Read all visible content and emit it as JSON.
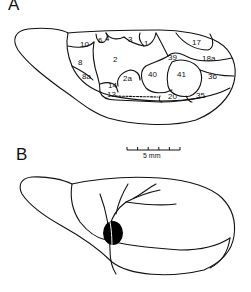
{
  "panels": {
    "a": {
      "label": "A"
    },
    "b": {
      "label": "B"
    }
  },
  "areas": [
    {
      "name": "10",
      "x": 84,
      "y": 44
    },
    {
      "name": "6",
      "x": 100,
      "y": 40
    },
    {
      "name": "4",
      "x": 107,
      "y": 38
    },
    {
      "name": "3",
      "x": 130,
      "y": 38
    },
    {
      "name": "1",
      "x": 145,
      "y": 43
    },
    {
      "name": "17",
      "x": 196,
      "y": 43
    },
    {
      "name": "2",
      "x": 115,
      "y": 60
    },
    {
      "name": "39",
      "x": 173,
      "y": 59
    },
    {
      "name": "18a",
      "x": 206,
      "y": 60
    },
    {
      "name": "8",
      "x": 80,
      "y": 64
    },
    {
      "name": "2a",
      "x": 127,
      "y": 79
    },
    {
      "name": "40",
      "x": 153,
      "y": 77
    },
    {
      "name": "41",
      "x": 182,
      "y": 77
    },
    {
      "name": "36",
      "x": 211,
      "y": 79
    },
    {
      "name": "8a",
      "x": 85,
      "y": 78
    },
    {
      "name": "14",
      "x": 110,
      "y": 87
    },
    {
      "name": "13",
      "x": 108,
      "y": 96
    },
    {
      "name": "20",
      "x": 171,
      "y": 99
    },
    {
      "name": "35",
      "x": 197,
      "y": 98
    }
  ],
  "scale_bar": {
    "label": "5 mm"
  },
  "colors": {
    "ink": "#111111",
    "lesion": "#000000",
    "background": "#ffffff"
  }
}
